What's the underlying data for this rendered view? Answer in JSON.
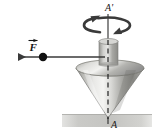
{
  "figure": {
    "background_color": "#ffffff",
    "labels": {
      "axis_top": "A'",
      "axis_bottom": "A",
      "force": "F"
    },
    "colors": {
      "ink": "#1a1a1a",
      "cone_light": "#f2f2f0",
      "cone_mid": "#b9b9b5",
      "cone_dark": "#6e6e6a",
      "cone_edge": "#8a8a86",
      "ground": "#c9c9c6",
      "arrow": "#3a3a3a",
      "dashed_axis": "#262626"
    },
    "geometry": {
      "axis_x": 108,
      "axis_top_y": 14,
      "axis_bottom_y": 124,
      "cone_top_cx": 110,
      "cone_top_cy": 68,
      "cone_top_rx": 34,
      "cone_top_ry": 8,
      "cone_tip_x": 108,
      "cone_tip_y": 118,
      "stem_x": 99,
      "stem_y": 41,
      "stem_w": 19,
      "stem_h": 24,
      "spin_ellipse_cx": 107,
      "spin_ellipse_cy": 25,
      "spin_ellipse_rx": 24,
      "spin_ellipse_ry": 8,
      "force_line_y": 57,
      "force_line_x_start": 105,
      "force_line_x_end": 10,
      "force_dot_x": 43,
      "force_dot_y": 57,
      "force_dot_r": 4,
      "ground_x": 62,
      "ground_y": 114,
      "ground_w": 90,
      "ground_h": 13
    },
    "elements": {
      "cone_name": "spinning-top-cone",
      "stem_name": "spinning-top-stem",
      "spin_arrow_name": "spin-rotation-arrow",
      "force_arrow_name": "force-vector-arrow",
      "pivot_dot_name": "force-application-point",
      "dashed_axis_name": "rotation-axis-dashed-line",
      "ground_name": "ground-surface"
    }
  }
}
